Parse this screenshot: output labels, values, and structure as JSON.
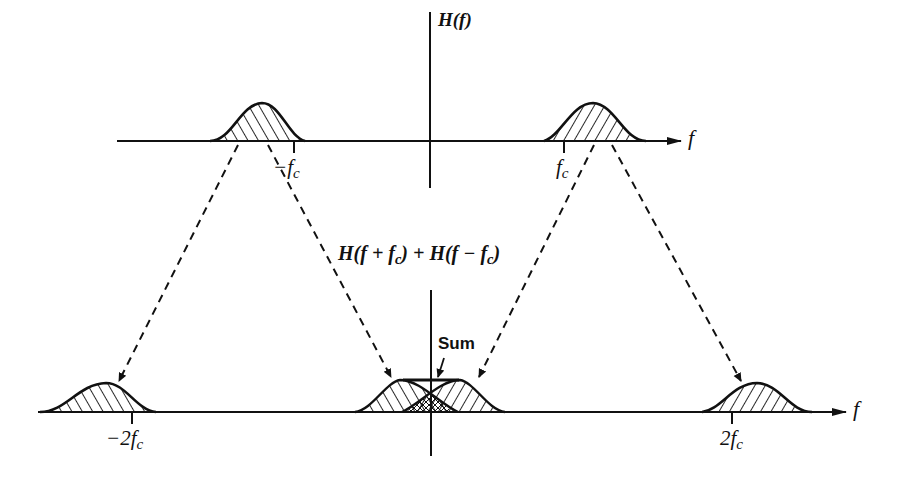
{
  "diagram": {
    "top_panel": {
      "axis_label": "f",
      "vertical_axis_label": "H(f)",
      "ticks": [
        {
          "id": "neg_fc",
          "label_main": "−f",
          "label_sub": "c"
        },
        {
          "id": "pos_fc",
          "label_main": "f",
          "label_sub": "c"
        }
      ]
    },
    "middle_label": {
      "part1": "H(f + f",
      "sub1": "c",
      "part2": ") + H(f − f",
      "sub2": "c",
      "part3": ")"
    },
    "bottom_panel": {
      "axis_label": "f",
      "sum_label": "Sum",
      "ticks": [
        {
          "id": "neg_2fc",
          "label_main": "−2f",
          "label_sub": "c"
        },
        {
          "id": "pos_2fc",
          "label_main": "2f",
          "label_sub": "c"
        }
      ]
    },
    "colors": {
      "ink": "#111111",
      "background": "#ffffff"
    }
  }
}
